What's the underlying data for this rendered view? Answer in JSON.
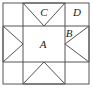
{
  "figure": {
    "name": "star-quilt-block",
    "stroke_color": "#555555",
    "background_color": "#ffffff",
    "outline": {
      "x": 3,
      "y": 3,
      "width": 86,
      "height": 81
    },
    "grid": {
      "vertical_dividers": [
        23,
        65
      ],
      "horizontal_dividers": [
        26,
        62
      ],
      "columns": 3,
      "rows": 3
    },
    "labels": [
      {
        "id": "A",
        "text": "A",
        "x": 43,
        "y": 45,
        "cell": "center"
      },
      {
        "id": "B",
        "text": "B",
        "x": 69,
        "y": 34,
        "cell": "right-edge"
      },
      {
        "id": "C",
        "text": "C",
        "x": 44,
        "y": 13,
        "cell": "top-edge"
      },
      {
        "id": "D",
        "text": "D",
        "x": 77,
        "y": 13,
        "cell": "top-right-corner"
      }
    ],
    "triangles": [
      {
        "id": "top",
        "direction": "points-down",
        "points": "23,3 65,3 44,26"
      },
      {
        "id": "right",
        "direction": "points-left",
        "points": "89,26 89,62 65,44"
      },
      {
        "id": "bottom",
        "direction": "points-up",
        "points": "23,84 65,84 44,62"
      },
      {
        "id": "left",
        "direction": "points-right",
        "points": "3,26 3,62 23,44"
      }
    ],
    "center_square": {
      "id": "A",
      "x": 23,
      "y": 26,
      "width": 42,
      "height": 36
    }
  }
}
